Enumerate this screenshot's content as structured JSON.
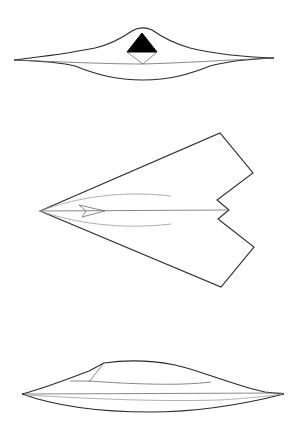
{
  "figure": {
    "views": [
      {
        "name": "front-view",
        "label": ""
      },
      {
        "name": "top-view",
        "label": ""
      },
      {
        "name": "side-view",
        "label": ""
      }
    ],
    "colors": {
      "background": "#ffffff",
      "line": "#2a2a2a",
      "fill_dark": "#000000"
    }
  }
}
